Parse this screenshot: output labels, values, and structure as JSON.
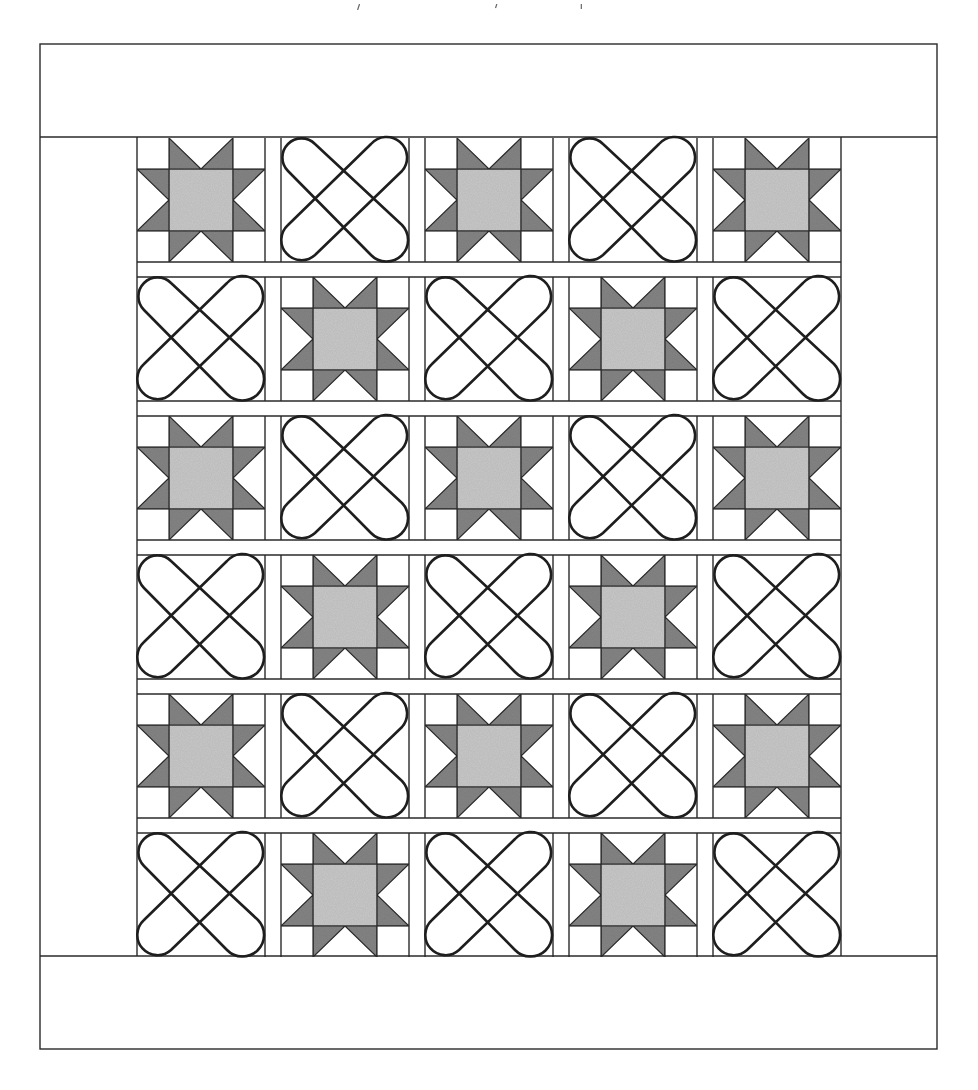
{
  "figure": {
    "outer_border": {
      "x": 40,
      "y": 44,
      "width": 897,
      "height": 1005
    },
    "top_border_bottom_y": 137,
    "bottom_border_top_y": 956,
    "block_area": {
      "left": 137,
      "right": 841
    },
    "columns_x": [
      137,
      281,
      425,
      569,
      713
    ],
    "rows_y": [
      138,
      277,
      416,
      555,
      694,
      833
    ],
    "block_width": 128,
    "block_height": 124,
    "layout": [
      [
        "star",
        "x",
        "star",
        "x",
        "star"
      ],
      [
        "x",
        "star",
        "x",
        "star",
        "x"
      ],
      [
        "star",
        "x",
        "star",
        "x",
        "star"
      ],
      [
        "x",
        "star",
        "x",
        "star",
        "x"
      ],
      [
        "star",
        "x",
        "star",
        "x",
        "star"
      ],
      [
        "x",
        "star",
        "x",
        "star",
        "x"
      ]
    ],
    "block_types": {
      "star": {
        "name": "Sawtooth Star",
        "icon": "star-block-icon"
      },
      "x": {
        "name": "Crossed bands",
        "icon": "x-block-icon"
      }
    },
    "colors": {
      "line": "#2a2a2a",
      "background": "#ffffff",
      "star_points": "#858585",
      "star_center": "#c9c9c9"
    },
    "stats": {
      "rows": 6,
      "columns": 5,
      "star_blocks": 15,
      "x_blocks": 15
    }
  }
}
